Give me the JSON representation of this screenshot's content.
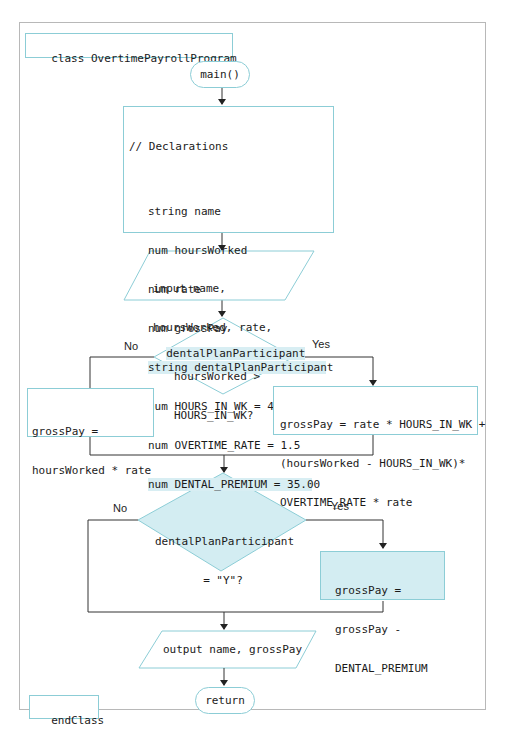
{
  "diagram": {
    "type": "flowchart",
    "class_header": "class OvertimePayrollProgram",
    "start_terminal": "main()",
    "declarations": {
      "comment": "// Declarations",
      "lines": [
        {
          "text": "string name",
          "highlight": false
        },
        {
          "text": "num hoursWorked",
          "highlight": false
        },
        {
          "text": "num rate",
          "highlight": false
        },
        {
          "text": "num grossPay",
          "highlight": false
        },
        {
          "text": "string dentalPlanParticipant",
          "highlight": true
        },
        {
          "text": "num HOURS_IN_WK = 40",
          "highlight": false
        },
        {
          "text": "num OVERTIME_RATE = 1.5",
          "highlight": false
        },
        {
          "text": "num DENTAL_PREMIUM = 35.00",
          "highlight": true
        }
      ]
    },
    "input": {
      "line1": "input name,",
      "line2": "hoursWorked, rate,",
      "line3": "dentalPlanParticipant"
    },
    "decision1": {
      "line1": "hoursWorked >",
      "line2": "HOURS_IN_WK?",
      "no_label": "No",
      "yes_label": "Yes"
    },
    "no_branch1": {
      "line1": "grossPay =",
      "line2": "hoursWorked * rate"
    },
    "yes_branch1": {
      "line1": "grossPay = rate * HOURS_IN_WK +",
      "line2": "(hoursWorked - HOURS_IN_WK)*",
      "line3": "OVERTIME_RATE * rate"
    },
    "decision2": {
      "line1": "dentalPlanParticipant",
      "line2": "= \"Y\"?",
      "no_label": "No",
      "yes_label": "Yes"
    },
    "yes_branch2": {
      "line1": "grossPay =",
      "line2": "grossPay -",
      "line3": "DENTAL_PREMIUM"
    },
    "output": "output name, grossPay",
    "end_terminal": "return",
    "class_footer": "endClass",
    "colors": {
      "shape_border": "#8ccdd6",
      "highlight_fill": "#d3edf2",
      "connector": "#333333",
      "frame_border": "#b8b8b8"
    }
  }
}
